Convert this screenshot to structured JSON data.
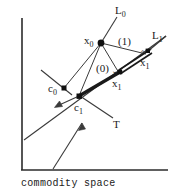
{
  "figure": {
    "caption": "commodity space",
    "stroke_color": "#2b2b2b",
    "background": "#ffffff"
  },
  "axes": {
    "y_axis_name": "vertical-axis",
    "x_axis_name": "horizontal-axis"
  },
  "labels": {
    "L0": {
      "base": "L",
      "sub": "0"
    },
    "L1": {
      "base": "L",
      "sub": "1"
    },
    "x0": {
      "base": "x",
      "sub": "0"
    },
    "x1_hat": {
      "accent": "ˆ",
      "base": "x",
      "sub": "1"
    },
    "x1_check": {
      "accent": "ˇ",
      "base": "x",
      "sub": "1"
    },
    "c0": {
      "base": "c",
      "sub": "0"
    },
    "c1": {
      "base": "c",
      "sub": "1"
    },
    "T": {
      "base": "T"
    },
    "zero": "(0)",
    "one": "(1)"
  },
  "points": [
    {
      "name": "x0",
      "x": 101,
      "y": 43
    },
    {
      "name": "c0",
      "x": 64,
      "y": 88
    },
    {
      "name": "c1",
      "x": 79,
      "y": 96
    },
    {
      "name": "x1_check",
      "x": 120,
      "y": 72
    },
    {
      "name": "x1_hat",
      "x": 148,
      "y": 51
    }
  ]
}
